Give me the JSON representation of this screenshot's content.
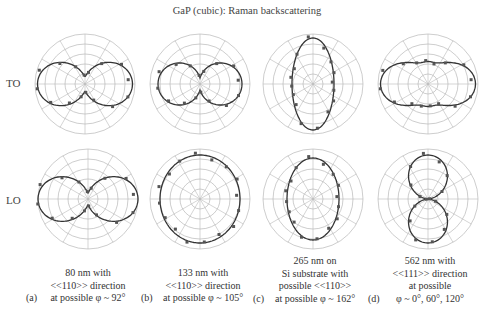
{
  "title": "GaP (cubic): Raman backscattering",
  "row_labels": {
    "to": "TO",
    "lo": "LO"
  },
  "captions": [
    {
      "tag": "(a)",
      "lines": [
        "80 nm with",
        "<<110>> direction",
        "at possible φ ~ 92°"
      ]
    },
    {
      "tag": "(b)",
      "lines": [
        "133 nm with",
        "<<110>> direction",
        "at possible φ ~ 105°"
      ]
    },
    {
      "tag": "(c)",
      "lines": [
        "265 nm on",
        "Si substrate with",
        "possible <<110>>",
        "at possible φ ~ 162°"
      ]
    },
    {
      "tag": "(d)",
      "lines": [
        "562 nm with",
        "<<111>> direction",
        "at possible",
        "φ ~ 0°, 60°, 120°"
      ]
    }
  ],
  "colors": {
    "grid": "#b8b8b8",
    "curve": "#333333",
    "points": "#555555"
  },
  "chart_data": [
    {
      "type": "polar",
      "panel": "a",
      "mode": "TO",
      "shape": "horizontal figure-eight (two lobes along 0°/180°)",
      "rings": 5,
      "spokes": 12
    },
    {
      "type": "polar",
      "panel": "b",
      "mode": "TO",
      "shape": "horizontal figure-eight, narrower lobes",
      "rings": 5,
      "spokes": 12
    },
    {
      "type": "polar",
      "panel": "c",
      "mode": "TO",
      "shape": "vertical ellipse",
      "rings": 5,
      "spokes": 12
    },
    {
      "type": "polar",
      "panel": "d",
      "mode": "TO",
      "shape": "horizontal lobes with small vertical lobes",
      "rings": 5,
      "spokes": 12
    },
    {
      "type": "polar",
      "panel": "a",
      "mode": "LO",
      "shape": "horizontal figure-eight",
      "rings": 5,
      "spokes": 12
    },
    {
      "type": "polar",
      "panel": "b",
      "mode": "LO",
      "shape": "near-circular ellipse",
      "rings": 5,
      "spokes": 12
    },
    {
      "type": "polar",
      "panel": "c",
      "mode": "LO",
      "shape": "vertical ellipse",
      "rings": 5,
      "spokes": 12
    },
    {
      "type": "polar",
      "panel": "d",
      "mode": "LO",
      "shape": "vertical figure-eight (two lobes along 90°/270°)",
      "rings": 5,
      "spokes": 12
    }
  ]
}
